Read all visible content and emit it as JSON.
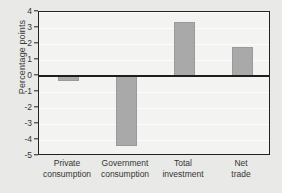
{
  "chart_data": {
    "type": "bar",
    "title": "",
    "subtitle": "",
    "xlabel": "",
    "ylabel": "Percentage points",
    "categories": [
      "Private consumption",
      "Government consumption",
      "Total investment",
      "Net trade"
    ],
    "category_lines": [
      [
        "Private",
        "consumption"
      ],
      [
        "Government",
        "consumption"
      ],
      [
        "Total",
        "investment"
      ],
      [
        "Net",
        "trade"
      ]
    ],
    "values": [
      -0.3,
      -4.4,
      3.35,
      1.8
    ],
    "ylim": [
      -5,
      4
    ],
    "yticks": [
      4,
      3,
      2,
      1,
      0,
      -1,
      -2,
      -3,
      -4,
      -5
    ],
    "ytick_labels": [
      "4",
      "3",
      "2",
      "1",
      "0",
      "-1",
      "-2",
      "-3",
      "-4",
      "-5"
    ],
    "grid": true,
    "legend": null,
    "zero_line": 0,
    "bar_color": "#a9a9a9",
    "plot_background": "#f3f3f1",
    "figure_background": "#e9e9e7",
    "axis_color": "#232323",
    "gridline_color": "#fdfdfd"
  }
}
